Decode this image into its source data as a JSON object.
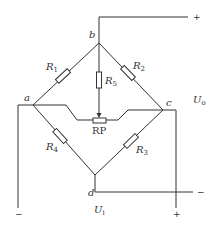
{
  "diagram": {
    "type": "wheatstone-bridge-circuit",
    "nodes": {
      "a": "a",
      "b": "b",
      "c": "c",
      "d": "d"
    },
    "resistors": {
      "r1": {
        "main": "R",
        "sub": "1"
      },
      "r2": {
        "main": "R",
        "sub": "2"
      },
      "r3": {
        "main": "R",
        "sub": "3"
      },
      "r4": {
        "main": "R",
        "sub": "4"
      },
      "r5": {
        "main": "R",
        "sub": "5"
      },
      "rp": "RP"
    },
    "output_voltage": {
      "main": "U",
      "sub": "o"
    },
    "input_voltage": {
      "main": "U",
      "sub": "i"
    },
    "terminals": {
      "output_plus": "+",
      "output_minus": "−",
      "input_minus": "−",
      "input_plus": "+"
    },
    "colors": {
      "line": "#333333",
      "background": "#ffffff"
    }
  }
}
